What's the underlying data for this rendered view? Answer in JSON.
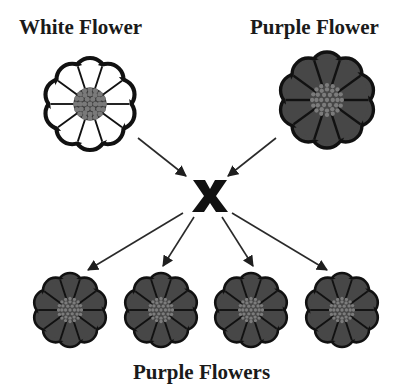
{
  "diagram": {
    "parents": [
      {
        "label": "White Flower",
        "color": "white",
        "fill": "#ffffff"
      },
      {
        "label": "Purple Flower",
        "color": "purple",
        "fill": "#474747"
      }
    ],
    "cross_symbol": "x",
    "offspring": {
      "label": "Purple Flowers",
      "count": 4,
      "color": "purple",
      "fill": "#474747"
    },
    "colors": {
      "outline": "#111111",
      "purple_petal": "#474747",
      "center_dot": "#6e6e6e",
      "arrow": "#2a2a2a"
    }
  }
}
